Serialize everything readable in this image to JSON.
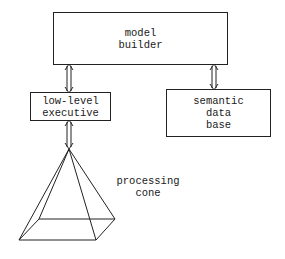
{
  "diagram": {
    "nodes": [
      {
        "id": "model-builder",
        "label": "model\nbuilder"
      },
      {
        "id": "low-level-executive",
        "label": "low-level\nexecutive"
      },
      {
        "id": "semantic-data-base",
        "label": "semantic\ndata\nbase"
      },
      {
        "id": "processing-cone",
        "label": "processing\ncone"
      }
    ],
    "edges": [
      {
        "from": "model-builder",
        "to": "low-level-executive",
        "type": "bidirectional"
      },
      {
        "from": "model-builder",
        "to": "semantic-data-base",
        "type": "bidirectional"
      },
      {
        "from": "low-level-executive",
        "to": "processing-cone",
        "type": "bidirectional"
      }
    ],
    "colors": {
      "line": "#222222",
      "text": "#1a1a1a",
      "background": "#ffffff"
    }
  }
}
